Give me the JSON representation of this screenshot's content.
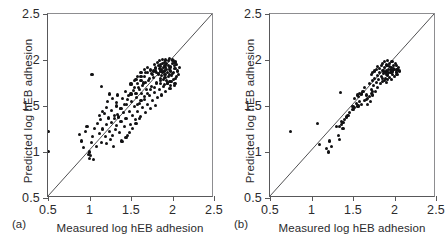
{
  "figure": {
    "panels": [
      {
        "id": "a",
        "label": "(a)",
        "xlabel": "Measured log hEB adhesion",
        "ylabel": "Predicted log hEB adhesion"
      },
      {
        "id": "b",
        "label": "(b)",
        "xlabel": "Measured log hEB adhesion",
        "ylabel": "Predicted log hEB adhesion"
      }
    ],
    "tick_labels": [
      "0.5",
      "1",
      "1.5",
      "2",
      "2.5"
    ]
  },
  "chart_data": [
    {
      "type": "scatter",
      "panel": "a",
      "title": "",
      "xlabel": "Measured log hEB adhesion",
      "ylabel": "Predicted log hEB adhesion",
      "xlim": [
        0.5,
        2.5
      ],
      "ylim": [
        0.5,
        2.5
      ],
      "xticks": [
        0.5,
        1,
        1.5,
        2,
        2.5
      ],
      "yticks": [
        0.5,
        1,
        1.5,
        2,
        2.5
      ],
      "grid": false,
      "legend": "none",
      "annotations": [
        "identity line y = x from (0.5,0.5) to (2.5,2.5)"
      ],
      "reference_line": {
        "type": "identity",
        "x": [
          0.5,
          2.5
        ],
        "y": [
          0.5,
          2.5
        ]
      },
      "points": [
        [
          0.5,
          1.22
        ],
        [
          0.5,
          1.01
        ],
        [
          0.88,
          1.19
        ],
        [
          0.9,
          1.12
        ],
        [
          0.93,
          1.05
        ],
        [
          0.95,
          1.22
        ],
        [
          0.97,
          1.28
        ],
        [
          0.99,
          0.97
        ],
        [
          1.0,
          1.0
        ],
        [
          1.0,
          0.93
        ],
        [
          1.01,
          0.96
        ],
        [
          1.02,
          1.1
        ],
        [
          1.03,
          1.84
        ],
        [
          1.04,
          1.17
        ],
        [
          1.05,
          0.92
        ],
        [
          1.06,
          1.26
        ],
        [
          1.08,
          1.06
        ],
        [
          1.1,
          1.31
        ],
        [
          1.12,
          1.2
        ],
        [
          1.13,
          1.35
        ],
        [
          1.14,
          1.71
        ],
        [
          1.15,
          1.1
        ],
        [
          1.16,
          1.25
        ],
        [
          1.18,
          1.42
        ],
        [
          1.19,
          1.17
        ],
        [
          1.2,
          1.09
        ],
        [
          1.21,
          1.3
        ],
        [
          1.22,
          1.55
        ],
        [
          1.23,
          1.37
        ],
        [
          1.24,
          1.22
        ],
        [
          1.25,
          1.14
        ],
        [
          1.26,
          1.45
        ],
        [
          1.27,
          1.32
        ],
        [
          1.28,
          1.18
        ],
        [
          1.29,
          1.06
        ],
        [
          1.3,
          1.4
        ],
        [
          1.31,
          1.24
        ],
        [
          1.32,
          1.5
        ],
        [
          1.33,
          1.29
        ],
        [
          1.34,
          1.62
        ],
        [
          1.35,
          1.38
        ],
        [
          1.36,
          1.21
        ],
        [
          1.37,
          1.47
        ],
        [
          1.38,
          1.33
        ],
        [
          1.39,
          1.12
        ],
        [
          1.4,
          1.58
        ],
        [
          1.41,
          1.43
        ],
        [
          1.42,
          1.28
        ],
        [
          1.43,
          1.66
        ],
        [
          1.44,
          1.36
        ],
        [
          1.45,
          1.52
        ],
        [
          1.46,
          1.18
        ],
        [
          1.47,
          1.61
        ],
        [
          1.48,
          1.44
        ],
        [
          1.49,
          1.3
        ],
        [
          1.5,
          1.73
        ],
        [
          1.51,
          1.55
        ],
        [
          1.52,
          1.4
        ],
        [
          1.53,
          1.67
        ],
        [
          1.54,
          1.49
        ],
        [
          1.55,
          1.35
        ],
        [
          1.56,
          1.79
        ],
        [
          1.57,
          1.59
        ],
        [
          1.58,
          1.44
        ],
        [
          1.59,
          1.7
        ],
        [
          1.6,
          1.53
        ],
        [
          1.61,
          1.39
        ],
        [
          1.62,
          1.82
        ],
        [
          1.63,
          1.64
        ],
        [
          1.64,
          1.48
        ],
        [
          1.65,
          1.75
        ],
        [
          1.66,
          1.57
        ],
        [
          1.67,
          1.43
        ],
        [
          1.68,
          1.86
        ],
        [
          1.69,
          1.68
        ],
        [
          1.7,
          1.52
        ],
        [
          1.71,
          1.78
        ],
        [
          1.72,
          1.61
        ],
        [
          1.73,
          1.47
        ],
        [
          1.74,
          1.89
        ],
        [
          1.75,
          1.71
        ],
        [
          1.76,
          1.56
        ],
        [
          1.77,
          1.81
        ],
        [
          1.78,
          1.65
        ],
        [
          1.79,
          1.51
        ],
        [
          1.8,
          1.92
        ],
        [
          1.81,
          1.74
        ],
        [
          1.82,
          1.59
        ],
        [
          1.83,
          1.84
        ],
        [
          1.84,
          1.68
        ],
        [
          1.85,
          1.95
        ],
        [
          1.86,
          1.78
        ],
        [
          1.87,
          1.62
        ],
        [
          1.88,
          1.87
        ],
        [
          1.89,
          1.71
        ],
        [
          1.9,
          1.97
        ],
        [
          1.91,
          1.81
        ],
        [
          1.92,
          1.66
        ],
        [
          1.93,
          1.9
        ],
        [
          1.94,
          1.74
        ],
        [
          1.95,
          1.99
        ],
        [
          1.96,
          1.84
        ],
        [
          1.97,
          1.69
        ],
        [
          1.98,
          1.93
        ],
        [
          1.99,
          1.77
        ],
        [
          2.0,
          1.96
        ],
        [
          2.01,
          1.86
        ],
        [
          2.02,
          1.72
        ],
        [
          2.03,
          1.91
        ],
        [
          2.04,
          1.8
        ],
        [
          1.78,
          1.95
        ],
        [
          1.82,
          1.97
        ],
        [
          1.86,
          1.93
        ],
        [
          1.9,
          1.88
        ],
        [
          1.84,
          1.91
        ],
        [
          1.88,
          1.96
        ],
        [
          1.92,
          1.92
        ],
        [
          1.96,
          1.9
        ],
        [
          1.94,
          1.86
        ],
        [
          1.98,
          1.88
        ],
        [
          2.0,
          1.85
        ],
        [
          2.02,
          1.94
        ],
        [
          1.8,
          1.88
        ],
        [
          1.83,
          1.85
        ],
        [
          1.87,
          1.83
        ],
        [
          1.91,
          1.84
        ],
        [
          1.95,
          1.82
        ],
        [
          1.99,
          1.83
        ],
        [
          1.85,
          1.8
        ],
        [
          1.89,
          1.79
        ],
        [
          1.93,
          1.78
        ],
        [
          1.97,
          1.77
        ],
        [
          2.01,
          1.79
        ],
        [
          2.05,
          1.82
        ],
        [
          1.81,
          1.76
        ],
        [
          1.86,
          1.74
        ],
        [
          1.9,
          1.73
        ],
        [
          1.94,
          1.75
        ],
        [
          1.98,
          1.72
        ],
        [
          2.03,
          1.74
        ],
        [
          1.76,
          1.84
        ],
        [
          1.72,
          1.8
        ],
        [
          1.68,
          1.76
        ],
        [
          1.64,
          1.72
        ],
        [
          1.6,
          1.68
        ],
        [
          1.56,
          1.64
        ],
        [
          1.74,
          1.9
        ],
        [
          1.7,
          1.86
        ],
        [
          1.66,
          1.82
        ],
        [
          1.62,
          1.78
        ],
        [
          1.58,
          1.74
        ],
        [
          1.54,
          1.7
        ],
        [
          1.88,
          2.01
        ],
        [
          1.92,
          2.0
        ],
        [
          1.96,
          2.02
        ],
        [
          2.0,
          2.0
        ],
        [
          1.84,
          1.99
        ],
        [
          2.04,
          1.98
        ],
        [
          1.5,
          1.63
        ],
        [
          1.46,
          1.57
        ],
        [
          1.42,
          1.52
        ],
        [
          1.38,
          1.47
        ],
        [
          1.34,
          1.41
        ],
        [
          1.3,
          1.36
        ],
        [
          1.52,
          1.26
        ],
        [
          1.48,
          1.21
        ],
        [
          1.56,
          1.31
        ],
        [
          1.6,
          1.36
        ],
        [
          1.44,
          1.16
        ],
        [
          1.4,
          1.11
        ],
        [
          1.7,
          1.64
        ],
        [
          1.74,
          1.68
        ],
        [
          1.78,
          1.7
        ],
        [
          1.66,
          1.6
        ],
        [
          1.62,
          1.56
        ],
        [
          1.58,
          1.52
        ],
        [
          2.06,
          1.88
        ],
        [
          2.08,
          1.92
        ],
        [
          2.05,
          1.95
        ],
        [
          2.07,
          1.84
        ],
        [
          2.03,
          1.97
        ],
        [
          2.01,
          1.99
        ],
        [
          1.91,
          1.94
        ],
        [
          1.87,
          1.9
        ],
        [
          1.93,
          1.96
        ],
        [
          1.89,
          1.92
        ],
        [
          1.95,
          1.94
        ],
        [
          1.97,
          1.92
        ],
        [
          1.83,
          1.94
        ],
        [
          1.79,
          1.91
        ],
        [
          1.85,
          1.88
        ],
        [
          1.81,
          1.86
        ],
        [
          1.77,
          1.88
        ],
        [
          1.75,
          1.85
        ],
        [
          1.66,
          1.9
        ],
        [
          1.62,
          1.86
        ],
        [
          1.58,
          1.82
        ],
        [
          1.7,
          1.92
        ],
        [
          1.54,
          1.78
        ],
        [
          1.5,
          1.74
        ],
        [
          1.24,
          1.63
        ],
        [
          1.28,
          1.58
        ],
        [
          1.32,
          1.54
        ],
        [
          1.2,
          1.48
        ],
        [
          1.16,
          1.44
        ],
        [
          1.12,
          1.4
        ]
      ]
    },
    {
      "type": "scatter",
      "panel": "b",
      "title": "",
      "xlabel": "Measured log hEB adhesion",
      "ylabel": "Predicted log hEB adhesion",
      "xlim": [
        0.5,
        2.5
      ],
      "ylim": [
        0.5,
        2.5
      ],
      "xticks": [
        0.5,
        1,
        1.5,
        2,
        2.5
      ],
      "yticks": [
        0.5,
        1,
        1.5,
        2,
        2.5
      ],
      "grid": false,
      "legend": "none",
      "annotations": [
        "identity line y = x from (0.5,0.5) to (2.5,2.5)"
      ],
      "reference_line": {
        "type": "identity",
        "x": [
          0.5,
          2.5
        ],
        "y": [
          0.5,
          2.5
        ]
      },
      "points": [
        [
          0.75,
          1.22
        ],
        [
          1.07,
          1.31
        ],
        [
          1.1,
          1.08
        ],
        [
          1.18,
          1.04
        ],
        [
          1.2,
          1.0
        ],
        [
          1.22,
          1.12
        ],
        [
          1.24,
          1.06
        ],
        [
          1.3,
          1.28
        ],
        [
          1.33,
          1.18
        ],
        [
          1.34,
          1.14
        ],
        [
          1.35,
          1.65
        ],
        [
          1.36,
          1.33
        ],
        [
          1.38,
          1.26
        ],
        [
          1.46,
          1.43
        ],
        [
          1.5,
          1.49
        ],
        [
          1.52,
          1.58
        ],
        [
          1.55,
          1.62
        ],
        [
          1.57,
          1.6
        ],
        [
          1.58,
          1.64
        ],
        [
          1.6,
          1.63
        ],
        [
          1.62,
          1.66
        ],
        [
          1.64,
          1.7
        ],
        [
          1.66,
          1.57
        ],
        [
          1.68,
          1.52
        ],
        [
          1.7,
          1.74
        ],
        [
          1.71,
          1.55
        ],
        [
          1.72,
          1.68
        ],
        [
          1.73,
          1.78
        ],
        [
          1.74,
          1.62
        ],
        [
          1.75,
          1.72
        ],
        [
          1.76,
          1.8
        ],
        [
          1.77,
          1.66
        ],
        [
          1.78,
          1.76
        ],
        [
          1.79,
          1.83
        ],
        [
          1.8,
          1.7
        ],
        [
          1.81,
          1.79
        ],
        [
          1.82,
          1.86
        ],
        [
          1.83,
          1.74
        ],
        [
          1.84,
          1.82
        ],
        [
          1.85,
          1.89
        ],
        [
          1.86,
          1.77
        ],
        [
          1.87,
          1.85
        ],
        [
          1.88,
          1.92
        ],
        [
          1.89,
          1.8
        ],
        [
          1.9,
          1.88
        ],
        [
          1.91,
          1.94
        ],
        [
          1.92,
          1.83
        ],
        [
          1.93,
          1.9
        ],
        [
          1.94,
          1.96
        ],
        [
          1.95,
          1.86
        ],
        [
          1.96,
          1.92
        ],
        [
          1.97,
          1.98
        ],
        [
          1.98,
          1.88
        ],
        [
          1.99,
          1.94
        ],
        [
          2.0,
          1.9
        ],
        [
          1.84,
          1.94
        ],
        [
          1.86,
          1.96
        ],
        [
          1.88,
          1.98
        ],
        [
          1.9,
          1.95
        ],
        [
          1.92,
          1.99
        ],
        [
          1.94,
          1.93
        ],
        [
          1.82,
          1.91
        ],
        [
          1.8,
          1.93
        ],
        [
          1.78,
          1.9
        ],
        [
          1.76,
          1.88
        ],
        [
          1.74,
          1.86
        ],
        [
          1.72,
          1.84
        ],
        [
          1.96,
          1.86
        ],
        [
          1.98,
          1.84
        ],
        [
          2.0,
          1.82
        ],
        [
          2.02,
          1.87
        ],
        [
          2.04,
          1.9
        ],
        [
          2.03,
          1.84
        ],
        [
          1.86,
          1.8
        ],
        [
          1.88,
          1.78
        ],
        [
          1.9,
          1.76
        ],
        [
          1.92,
          1.79
        ],
        [
          1.94,
          1.81
        ],
        [
          1.96,
          1.79
        ],
        [
          1.7,
          1.6
        ],
        [
          1.68,
          1.58
        ],
        [
          1.66,
          1.62
        ],
        [
          1.72,
          1.64
        ],
        [
          1.74,
          1.66
        ],
        [
          1.64,
          1.56
        ],
        [
          1.6,
          1.52
        ],
        [
          1.58,
          1.55
        ],
        [
          1.56,
          1.5
        ],
        [
          1.54,
          1.53
        ],
        [
          1.52,
          1.48
        ],
        [
          1.5,
          1.46
        ],
        [
          1.4,
          1.35
        ],
        [
          1.42,
          1.38
        ],
        [
          1.44,
          1.4
        ],
        [
          1.38,
          1.32
        ],
        [
          1.36,
          1.3
        ],
        [
          1.34,
          1.28
        ],
        [
          1.93,
          1.86
        ],
        [
          1.95,
          1.9
        ],
        [
          1.97,
          1.88
        ],
        [
          1.91,
          1.84
        ],
        [
          1.89,
          1.86
        ],
        [
          1.87,
          1.88
        ],
        [
          2.05,
          1.92
        ],
        [
          2.06,
          1.88
        ],
        [
          2.02,
          1.94
        ],
        [
          2.01,
          1.96
        ],
        [
          1.99,
          1.91
        ],
        [
          2.03,
          1.9
        ]
      ]
    }
  ]
}
